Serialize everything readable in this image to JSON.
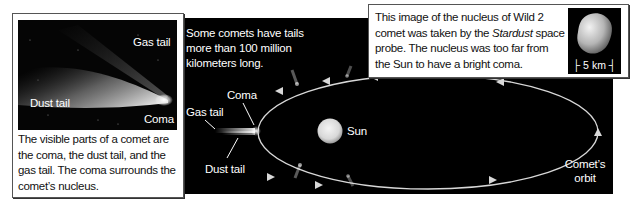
{
  "panel": {
    "caption": "Some comets have tails more than 100 million kilometers long.",
    "labels": {
      "coma": "Coma",
      "gas_tail": "Gas tail",
      "dust_tail": "Dust tail",
      "sun": "Sun",
      "orbit_line1": "Comet’s",
      "orbit_line2": "orbit"
    },
    "colors": {
      "background": "#000000",
      "orbit": "#d8d8d8",
      "sun": "#e6e6e6"
    }
  },
  "left_box": {
    "photo_labels": {
      "gas_tail": "Gas tail",
      "dust_tail": "Dust tail",
      "coma": "Coma"
    },
    "caption": "The visible parts of a comet are the coma, the dust tail, and the gas tail. The coma surrounds the comet’s nucleus."
  },
  "right_box": {
    "caption_part1": "This image of the nucleus of Wild 2 comet was taken by the ",
    "caption_italic": "Stardust",
    "caption_part2": " space probe. The nucleus was too far from the Sun to have a bright coma.",
    "scale_label": "├ 5 km ┤"
  }
}
